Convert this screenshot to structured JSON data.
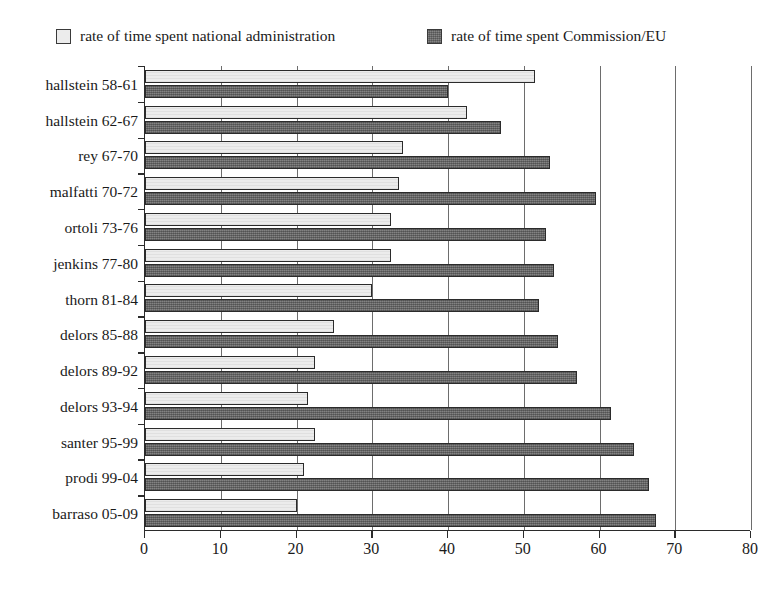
{
  "title": "",
  "legend": {
    "position": "top",
    "items": [
      {
        "label": "rate of time spent national administration",
        "swatch": "light",
        "color": "#ececec"
      },
      {
        "label": "rate of time spent Commission/EU",
        "swatch": "dark",
        "color": "#6f6f6f"
      }
    ]
  },
  "axis": {
    "x_ticks": [
      "0",
      "10",
      "20",
      "30",
      "40",
      "50",
      "60",
      "70",
      "80"
    ]
  },
  "chart_data": {
    "type": "bar",
    "orientation": "horizontal",
    "title": "",
    "xlabel": "",
    "ylabel": "",
    "xlim": [
      0,
      80
    ],
    "xticks": [
      0,
      10,
      20,
      30,
      40,
      50,
      60,
      70,
      80
    ],
    "grid": true,
    "legend_position": "top",
    "categories": [
      "hallstein 58-61",
      "hallstein 62-67",
      "rey 67-70",
      "malfatti 70-72",
      "ortoli 73-76",
      "jenkins 77-80",
      "thorn 81-84",
      "delors 85-88",
      "delors 89-92",
      "delors 93-94",
      "santer 95-99",
      "prodi 99-04",
      "barraso 05-09"
    ],
    "series": [
      {
        "name": "rate of time spent national administration",
        "color": "#ececec",
        "values": [
          51.5,
          42.5,
          34.0,
          33.5,
          32.5,
          32.5,
          30.0,
          25.0,
          22.5,
          21.5,
          22.5,
          21.0,
          20.0
        ]
      },
      {
        "name": "rate of time spent Commission/EU",
        "color": "#6f6f6f",
        "values": [
          40.0,
          47.0,
          53.5,
          59.5,
          53.0,
          54.0,
          52.0,
          54.5,
          57.0,
          61.5,
          64.5,
          66.5,
          67.5
        ]
      }
    ]
  }
}
